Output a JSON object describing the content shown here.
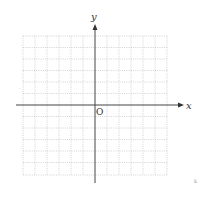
{
  "figure": {
    "x_axis_label": "x",
    "y_axis_label": "y",
    "origin_label": "O",
    "grid": {
      "columns": 12,
      "rows": 12,
      "style": "dotted",
      "color": "#c8c8c8"
    },
    "axis_color": "#444444",
    "stray_marks": [
      "·",
      "k"
    ]
  }
}
